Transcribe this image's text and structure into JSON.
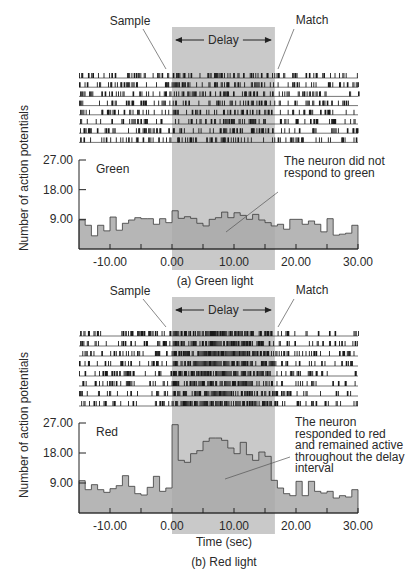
{
  "figure": {
    "ylabel": "Number of action potentials",
    "xlabel": "Time (sec)",
    "band_color": "#c9c9c9",
    "hist_fill": "#a9a9a9",
    "hist_stroke": "#3a3a3a",
    "raster_color": "#1a1a1a"
  },
  "chart_data": [
    {
      "type": "bar",
      "title": "(a) Green light",
      "panel_label": "Green",
      "xlabel": "",
      "ylabel": "Number of action potentials",
      "annotation": [
        "The neuron did not",
        "respond to green"
      ],
      "markers": {
        "sample": "Sample",
        "match": "Match",
        "delay": "Delay"
      },
      "delay_interval": [
        0,
        16.6
      ],
      "xlim": [
        -15,
        30
      ],
      "ylim": [
        0,
        27
      ],
      "xticks": [
        -10,
        0,
        10,
        20,
        30
      ],
      "xtick_labels": [
        "-10.00",
        "0.00",
        "10.00",
        "20.00",
        "30.00"
      ],
      "yticks": [
        9,
        18,
        27
      ],
      "ytick_labels": [
        "9.00",
        "18.00",
        "27.00"
      ],
      "bin_width": 1,
      "bin_start": -15,
      "values": [
        8.8,
        7.2,
        4.0,
        7.2,
        5.5,
        9.7,
        5.7,
        7.8,
        8.8,
        9.5,
        9.2,
        9.2,
        7.5,
        9.2,
        8.0,
        11.6,
        9.3,
        9.8,
        9.3,
        7.8,
        7.0,
        9.0,
        9.5,
        11.2,
        9.5,
        11.0,
        10.2,
        9.0,
        10.5,
        8.8,
        8.0,
        7.0,
        7.5,
        6.0,
        9.0,
        9.0,
        7.5,
        8.5,
        7.5,
        5.2,
        9.2,
        4.2,
        4.5,
        4.8,
        7.2
      ],
      "raster_trials": 8
    },
    {
      "type": "bar",
      "title": "(b) Red light",
      "panel_label": "Red",
      "xlabel": "Time (sec)",
      "ylabel": "Number of action potentials",
      "annotation": [
        "The neuron",
        "responded to red",
        "and remained active",
        "throughout the delay",
        "interval"
      ],
      "markers": {
        "sample": "Sample",
        "match": "Match",
        "delay": "Delay"
      },
      "delay_interval": [
        0,
        16.6
      ],
      "xlim": [
        -15,
        30
      ],
      "ylim": [
        0,
        27
      ],
      "xticks": [
        -10,
        0,
        10,
        20,
        30
      ],
      "xtick_labels": [
        "-10.00",
        "0.00",
        "10.00",
        "20.00",
        "30.00"
      ],
      "yticks": [
        9,
        18,
        27
      ],
      "ytick_labels": [
        "9.00",
        "18.00",
        "27.00"
      ],
      "bin_width": 1,
      "bin_start": -15,
      "values": [
        9.7,
        7.0,
        8.5,
        7.0,
        6.2,
        7.3,
        8.2,
        11.2,
        8.0,
        5.8,
        5.4,
        7.7,
        11.0,
        6.5,
        7.5,
        26.5,
        15.8,
        15.2,
        17.8,
        18.7,
        21.5,
        22.5,
        22.5,
        21.8,
        19.5,
        17.8,
        21.2,
        17.5,
        15.8,
        18.3,
        17.0,
        9.8,
        7.5,
        5.8,
        5.2,
        9.5,
        5.2,
        9.5,
        6.5,
        6.0,
        6.5,
        4.5,
        5.2,
        4.8,
        7.0
      ],
      "raster_trials": 8
    }
  ]
}
